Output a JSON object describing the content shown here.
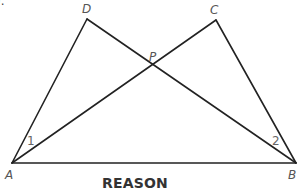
{
  "diagram": {
    "points": {
      "A": {
        "label": "A",
        "x": 12,
        "y": 163
      },
      "B": {
        "label": "B",
        "x": 296,
        "y": 163
      },
      "C": {
        "label": "C",
        "x": 216,
        "y": 20
      },
      "D": {
        "label": "D",
        "x": 87,
        "y": 19
      },
      "P": {
        "label": "P",
        "x": 153,
        "y": 67
      }
    },
    "segments": [
      "AD",
      "DB",
      "AC",
      "CB",
      "AB"
    ],
    "angle_labels": {
      "angle1": "1",
      "angle2": "2"
    },
    "line_color": "#222222"
  },
  "cut_off_text": ").",
  "section_heading": "REASON"
}
